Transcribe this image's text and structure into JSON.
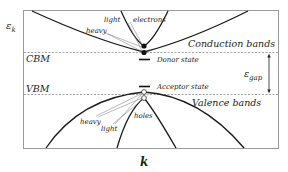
{
  "diagram": {
    "type": "semiconductor-band-structure",
    "axes": {
      "y_label": "ε",
      "y_label_sub": "k",
      "x_label": "k"
    },
    "levels": {
      "cbm_label": "CBM",
      "vbm_label": "VBM"
    },
    "bands": {
      "conduction_label": "Conduction bands",
      "valence_label": "Valence bands"
    },
    "states": {
      "donor_label": "Donor state",
      "acceptor_label": "Acceptor state"
    },
    "gap": {
      "symbol": "ε",
      "subscript": "gap"
    },
    "carriers": {
      "electrons_label": "electrons",
      "holes_label": "holes",
      "conduction_light_label": "light",
      "conduction_heavy_label": "heavy",
      "valence_heavy_label": "heavy",
      "valence_light_label": "light"
    },
    "colors": {
      "curve": "#1a1a1a",
      "frame": "#9a9a9a",
      "dashed": "#8a8a8a",
      "pointer": "#8c8c8c",
      "text": "#222222"
    }
  }
}
